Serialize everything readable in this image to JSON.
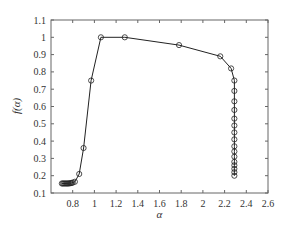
{
  "chart_data": {
    "type": "line",
    "title": "",
    "xlabel": "α",
    "ylabel": "f(α)",
    "xlim": [
      0.6,
      2.6
    ],
    "ylim": [
      0.1,
      1.1
    ],
    "xticks": [
      0.8,
      1,
      1.2,
      1.4,
      1.6,
      1.8,
      2,
      2.2,
      2.4,
      2.6
    ],
    "xtick_labels": [
      "0.8",
      "1",
      "1.2",
      "1.4",
      "1.6",
      "1.8",
      "2",
      "2.2",
      "2.4",
      "2.6"
    ],
    "yticks": [
      0.1,
      0.2,
      0.3,
      0.4,
      0.5,
      0.6,
      0.7,
      0.8,
      0.9,
      1.0,
      1.1
    ],
    "ytick_labels": [
      "0.1",
      "0.2",
      "0.3",
      "0.4",
      "0.5",
      "0.6",
      "0.7",
      "0.8",
      "0.9",
      "1",
      "1.1"
    ],
    "grid": false,
    "legend": null,
    "marker": "circle-open",
    "line_color": "#222222",
    "series": [
      {
        "name": "f(alpha)",
        "x": [
          0.7,
          0.71,
          0.72,
          0.73,
          0.74,
          0.75,
          0.76,
          0.77,
          0.78,
          0.79,
          0.8,
          0.82,
          0.86,
          0.9,
          0.97,
          1.06,
          1.28,
          1.78,
          2.16,
          2.26,
          2.29,
          2.29,
          2.29,
          2.29,
          2.29,
          2.29,
          2.29,
          2.29,
          2.29,
          2.29,
          2.29,
          2.29,
          2.29,
          2.29,
          2.29,
          2.29
        ],
        "y": [
          0.155,
          0.155,
          0.155,
          0.155,
          0.155,
          0.155,
          0.155,
          0.156,
          0.157,
          0.158,
          0.16,
          0.165,
          0.21,
          0.36,
          0.75,
          1.0,
          1.0,
          0.955,
          0.89,
          0.82,
          0.75,
          0.69,
          0.63,
          0.58,
          0.53,
          0.49,
          0.45,
          0.41,
          0.37,
          0.34,
          0.31,
          0.28,
          0.26,
          0.24,
          0.22,
          0.2
        ]
      }
    ]
  }
}
